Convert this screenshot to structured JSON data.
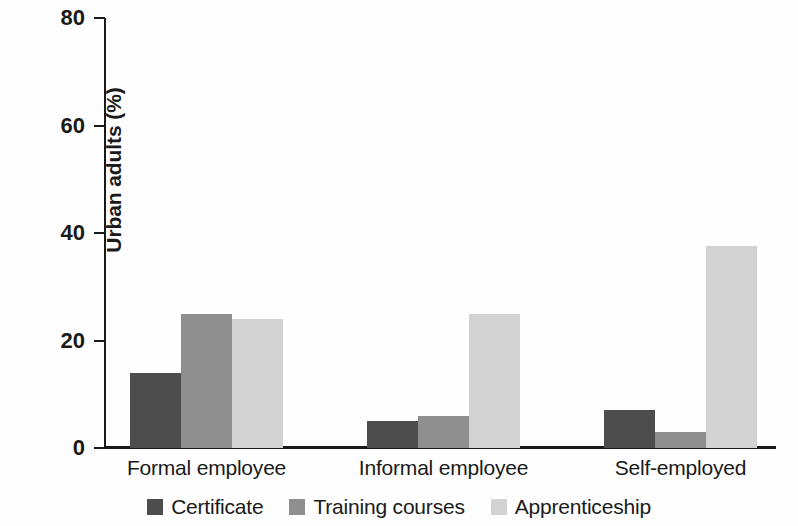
{
  "chart_data": {
    "type": "bar",
    "title": "",
    "subtitle": "",
    "xlabel": "",
    "ylabel": "Urban adults (%)",
    "ylim": [
      0,
      80
    ],
    "yticks": [
      0,
      20,
      40,
      60,
      80
    ],
    "ytick_labels": [
      "0",
      "20",
      "40",
      "60",
      "80"
    ],
    "grid": false,
    "legend_position": "bottom-center",
    "grouped": true,
    "bar_style": "adjacent",
    "categories": [
      "Formal employee",
      "Informal employee",
      "Self-employed"
    ],
    "series": [
      {
        "name": "Certificate",
        "color": "#4d4d4d",
        "values": [
          14,
          5,
          7
        ]
      },
      {
        "name": "Training courses",
        "color": "#8f8f8f",
        "values": [
          25,
          6,
          3
        ]
      },
      {
        "name": "Apprenticeship",
        "color": "#d2d2d2",
        "values": [
          24,
          25,
          37.5
        ]
      }
    ]
  },
  "axis": {
    "y_title": "Urban adults (%)"
  },
  "legend": {
    "items": [
      {
        "label": "Certificate",
        "color": "#4d4d4d"
      },
      {
        "label": "Training courses",
        "color": "#8f8f8f"
      },
      {
        "label": "Apprenticeship",
        "color": "#d2d2d2"
      }
    ]
  }
}
